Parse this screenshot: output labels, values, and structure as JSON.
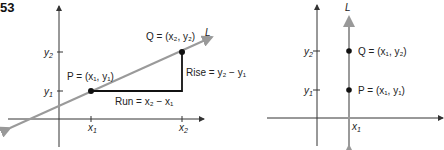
{
  "figure_number": "53",
  "left": {
    "line_label": "L",
    "y2_label": "y",
    "y2_sub": "2",
    "y1_label": "y",
    "y1_sub": "1",
    "x1_label": "x",
    "x1_sub": "1",
    "x2_label": "x",
    "x2_sub": "2",
    "p_label": "P = (x₁, y₁)",
    "q_label": "Q = (x₂, y₂)",
    "run_label": "Run = x₂ − x₁",
    "rise_label": "Rise = y₂ − y₁",
    "colors": {
      "line": "#9a9a9a",
      "axes": "#333333",
      "triangle": "#111111"
    }
  },
  "right": {
    "line_label": "L",
    "y2_label": "y",
    "y2_sub": "2",
    "y1_label": "y",
    "y1_sub": "1",
    "x1_label": "x",
    "x1_sub": "1",
    "p_label": "P = (x₁, y₁)",
    "q_label": "Q = (x₁, y₂)",
    "colors": {
      "line": "#9a9a9a",
      "axes": "#333333"
    }
  }
}
